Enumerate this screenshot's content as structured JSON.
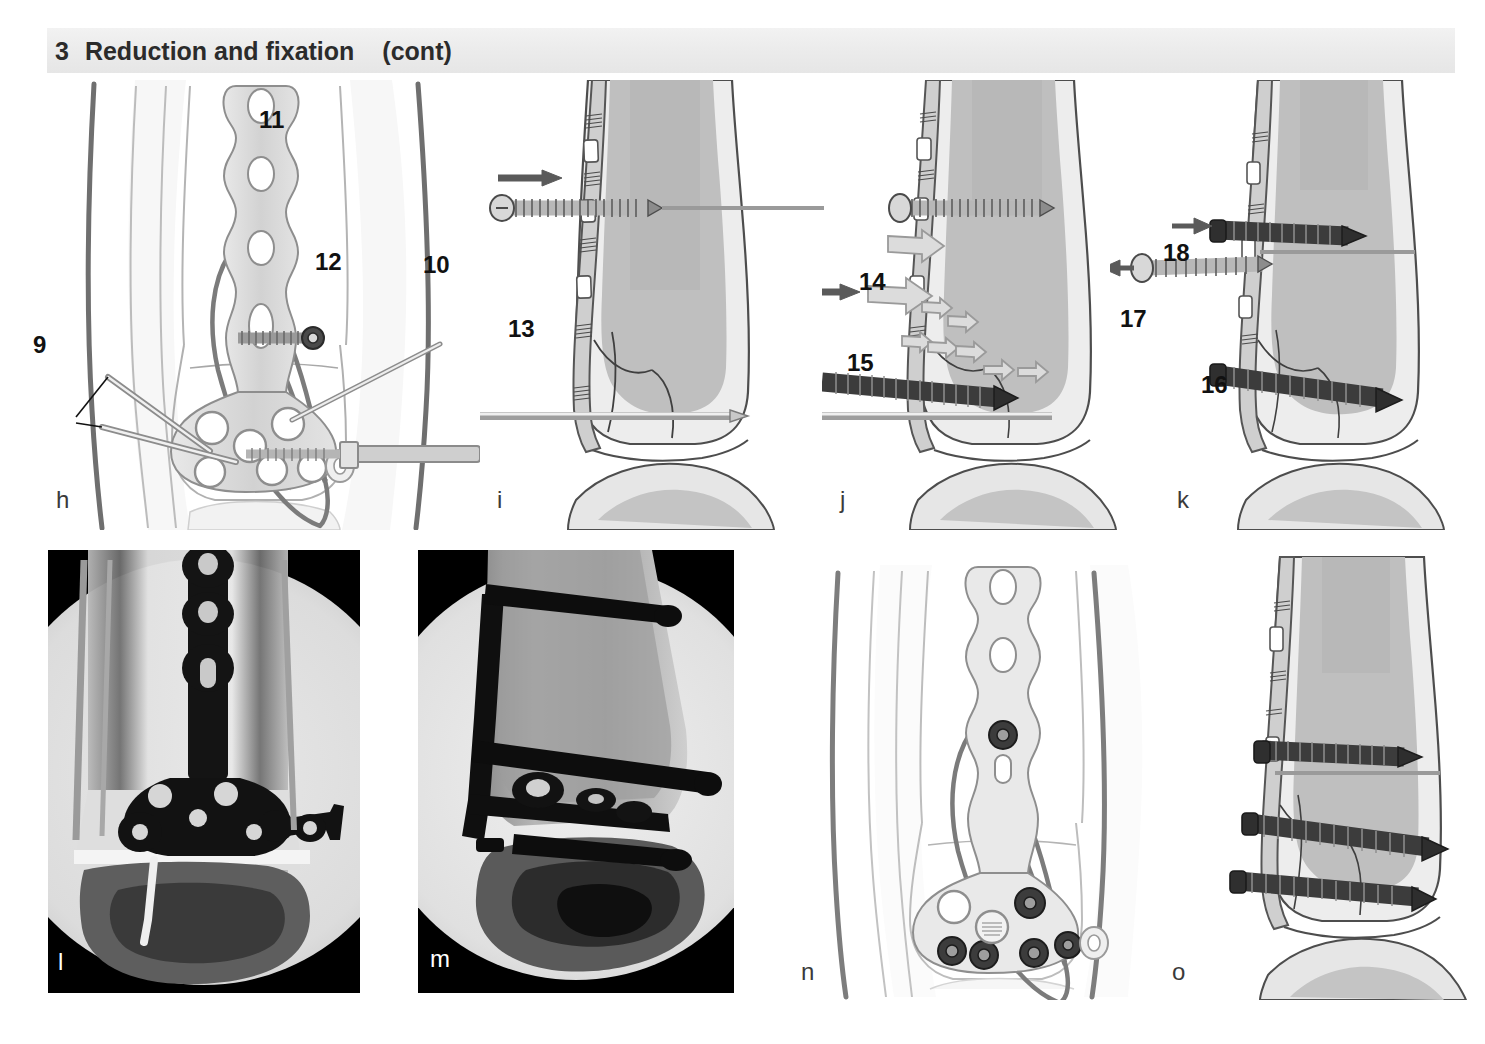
{
  "header": {
    "number": "3",
    "title": "Reduction and fixation",
    "continued": "(cont)"
  },
  "panels": [
    {
      "id": "h",
      "label": "h",
      "type": "illustration",
      "view": "anteroposterior",
      "description": "AP view of distal tibia with anterolateral plate, K-wires and screw",
      "callouts": [
        {
          "number": "9",
          "x": 33,
          "y": 333
        },
        {
          "number": "10",
          "x": 423,
          "y": 265
        },
        {
          "number": "11",
          "x": 259,
          "y": 114
        },
        {
          "number": "12",
          "x": 315,
          "y": 258
        }
      ]
    },
    {
      "id": "i",
      "label": "i",
      "type": "illustration",
      "view": "lateral",
      "description": "Lateral view, cortex screw inserted through plate",
      "callouts": [
        {
          "number": "13",
          "x": 508,
          "y": 325
        }
      ]
    },
    {
      "id": "j",
      "label": "j",
      "type": "illustration",
      "view": "lateral",
      "description": "Lateral view, locking head screw inserted, compression arrows",
      "callouts": [
        {
          "number": "14",
          "x": 859,
          "y": 278
        },
        {
          "number": "15",
          "x": 847,
          "y": 359
        }
      ]
    },
    {
      "id": "k",
      "label": "k",
      "type": "illustration",
      "view": "lateral",
      "description": "Lateral view, exchange of cortex screw for locking head screw",
      "callouts": [
        {
          "number": "16",
          "x": 1201,
          "y": 381
        },
        {
          "number": "17",
          "x": 1120,
          "y": 315
        },
        {
          "number": "18",
          "x": 1163,
          "y": 249
        }
      ]
    },
    {
      "id": "l",
      "label": "l",
      "type": "radiograph",
      "view": "anteroposterior",
      "description": "Intraoperative AP fluoroscopic image of plated distal tibia",
      "callouts": []
    },
    {
      "id": "m",
      "label": "m",
      "type": "radiograph",
      "view": "lateral",
      "description": "Intraoperative lateral fluoroscopic image of plated distal tibia",
      "callouts": []
    },
    {
      "id": "n",
      "label": "n",
      "type": "illustration",
      "view": "anteroposterior",
      "description": "AP view of completed fixation with all locking head screws",
      "callouts": []
    },
    {
      "id": "o",
      "label": "o",
      "type": "illustration",
      "view": "lateral",
      "description": "Lateral view of completed fixation with three locking head screws",
      "callouts": []
    }
  ],
  "colors": {
    "banner_background": "#ececec",
    "banner_text": "#2b2b2b",
    "page_background": "#ffffff",
    "outline_dark": "#555555",
    "bone_cortex": "#c9c9c9",
    "bone_cancellous": "#b0b0b0",
    "soft_tissue": "#e4e4e4",
    "implant_light": "#d8d8d8",
    "implant_dark": "#4a4a4a",
    "callout_text": "#111111",
    "xray_background": "#000000"
  }
}
